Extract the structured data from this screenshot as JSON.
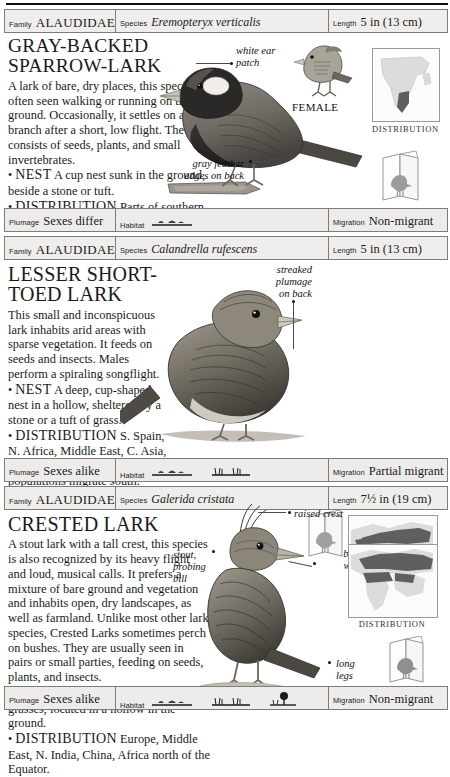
{
  "page": {
    "background": "#ffffff",
    "rule_color": "#111111"
  },
  "labels": {
    "family": "Family",
    "species": "Species",
    "length": "Length",
    "plumage": "Plumage",
    "habitat": "Habitat",
    "migration": "Migration",
    "distribution_caption": "DISTRIBUTION"
  },
  "entries": [
    {
      "family": "ALAUDIDAE",
      "species": "Eremopteryx verticalis",
      "length": "5 in (13 cm)",
      "common_name": "GRAY-BACKED SPARROW-LARK",
      "title_line1": "GRAY-BACKED",
      "title_line2": "SPARROW-LARK",
      "description": "A lark of bare, dry places, this species is often seen walking or running on the ground. Occasionally, it settles on a branch after a short, low flight. The diet consists of seeds, plants, and small invertebrates.",
      "nest_label": "NEST",
      "nest_text": "A cup nest sunk in the ground, beside a stone or tuft.",
      "distribution_label": "DISTRIBUTION",
      "distribution_text": "Parts of southern Africa.",
      "callouts": [
        {
          "name": "white-ear-patch",
          "line1": "white ear",
          "line2": "patch"
        },
        {
          "name": "gray-feather-edges",
          "line1": "gray feather",
          "line2": "edges on back"
        }
      ],
      "figure_caption": "FEMALE",
      "plumage": "Sexes differ",
      "habitat_icons": [
        "bare-ground"
      ],
      "migration": "Non-migrant",
      "map_region": "southern Africa"
    },
    {
      "family": "ALAUDIDAE",
      "species": "Calandrella rufescens",
      "length": "5 in (13 cm)",
      "common_name": "LESSER SHORT-TOED LARK",
      "title_line1": "LESSER SHORT-TOED LARK",
      "title_line2": "",
      "description": "This small and inconspicuous lark inhabits arid areas with sparse vegetation. It feeds on seeds and insects. Males perform a spiraling songflight.",
      "nest_label": "NEST",
      "nest_text": "A deep, cup-shaped nest in a hollow, sheltered by a stone or a tuft of grass.",
      "distribution_label": "DISTRIBUTION",
      "distribution_text": "S. Spain, N. Africa, Middle East, C. Asia, E. Asia. Northeastern populations migrate south.",
      "callouts": [
        {
          "name": "streaked-plumage-on-back",
          "line1": "streaked",
          "line2": "plumage",
          "line3": "on back"
        }
      ],
      "figure_caption": "",
      "plumage": "Sexes alike",
      "habitat_icons": [
        "bare-ground",
        "grass"
      ],
      "migration": "Partial migrant",
      "map_region": "Palearctic band"
    },
    {
      "family": "ALAUDIDAE",
      "species": "Galerida cristata",
      "length": "7½ in (19 cm)",
      "common_name": "CRESTED LARK",
      "title_line1": "CRESTED LARK",
      "title_line2": "",
      "description": "A stout lark with a tall crest, this species is also recognized by its heavy flight and loud, musical calls. It prefers a mixture of bare ground and vegetation and inhabits open, dry landscapes, as well as farmland. Unlike most other lark species, Crested Larks sometimes perch on bushes. They are usually seen in pairs or small parties, feeding on seeds, plants, and insects.",
      "nest_label": "NEST",
      "nest_text": "A deep cup nest made of grasses, located in a hollow in the ground.",
      "distribution_label": "DISTRIBUTION",
      "distribution_text": "Europe, Middle East, N. India, China, Africa north of the Equator.",
      "callouts": [
        {
          "name": "raised-crest",
          "line1": "raised crest"
        },
        {
          "name": "stout-probing-bill",
          "line1": "stout,",
          "line2": "probing",
          "line3": "bill"
        },
        {
          "name": "broad-wings",
          "line1": "broad",
          "line2": "wings"
        },
        {
          "name": "long-legs",
          "line1": "long",
          "line2": "legs"
        }
      ],
      "figure_caption": "",
      "plumage": "Sexes alike",
      "habitat_icons": [
        "bare-ground",
        "grass",
        "tree"
      ],
      "migration": "Non-migrant",
      "map_region": "Europe, N. Africa, Asia"
    }
  ],
  "colors": {
    "bar_fill": "#efeeec",
    "bar_border": "#7c7c7c",
    "map_range": "#6b6b6b",
    "map_land": "#d8d8d8",
    "text": "#1a1a1a"
  }
}
